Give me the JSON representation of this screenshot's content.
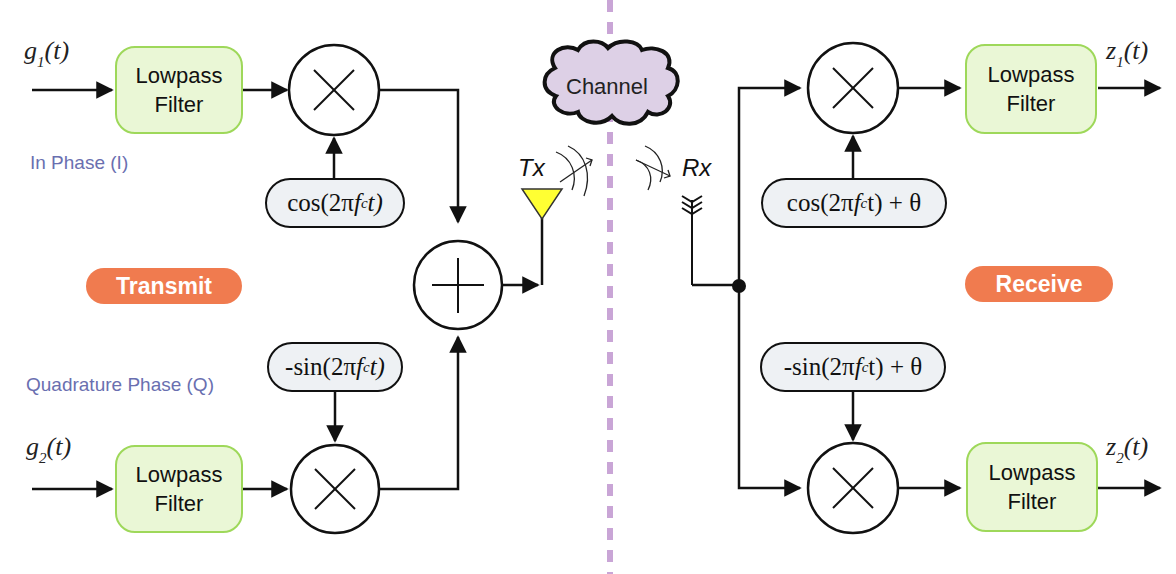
{
  "colors": {
    "filter_fill": "#eaf7d6",
    "filter_border": "#9ed85a",
    "oscillator_fill": "#eef1f4",
    "section_pill": "#f07b4f",
    "phase_label": "#6a6fb0",
    "divider": "#c9a5d6",
    "channel_cloud": "#ddd0e6",
    "tx_antenna": "#ffff33"
  },
  "transmit": {
    "section_label": "Transmit",
    "inputs": {
      "i_signal": {
        "base": "g",
        "sub": "1",
        "arg": "(t)"
      },
      "q_signal": {
        "base": "g",
        "sub": "2",
        "arg": "(t)"
      }
    },
    "phase_labels": {
      "in_phase": "In Phase (I)",
      "quadrature": "Quadrature Phase (Q)"
    },
    "filters": [
      {
        "label": "Lowpass\nFilter"
      },
      {
        "label": "Lowpass\nFilter"
      }
    ],
    "oscillators": {
      "cos": {
        "prefix": "cos(2π",
        "f": "f",
        "sub": "c",
        "suffix": "t)"
      },
      "sin": {
        "prefix": "-sin(2π",
        "f": "f",
        "sub": "c",
        "suffix": "t)"
      }
    },
    "mixer_symbol": "×",
    "adder_symbol": "+",
    "antenna_label": "Tx"
  },
  "channel": {
    "label": "Channel"
  },
  "receive": {
    "section_label": "Receive",
    "antenna_label": "Rx",
    "oscillators": {
      "cos": {
        "prefix": "cos(2π",
        "f": "f",
        "sub": "c",
        "suffix": "t) + θ"
      },
      "sin": {
        "prefix": "-sin(2π",
        "f": "f",
        "sub": "c",
        "suffix": "t) + θ"
      }
    },
    "filters": [
      {
        "label": "Lowpass\nFilter"
      },
      {
        "label": "Lowpass\nFilter"
      }
    ],
    "outputs": {
      "i_output": {
        "base": "z",
        "sub": "1",
        "arg": "(t)"
      },
      "q_output": {
        "base": "z",
        "sub": "2",
        "arg": "(t)"
      }
    }
  }
}
